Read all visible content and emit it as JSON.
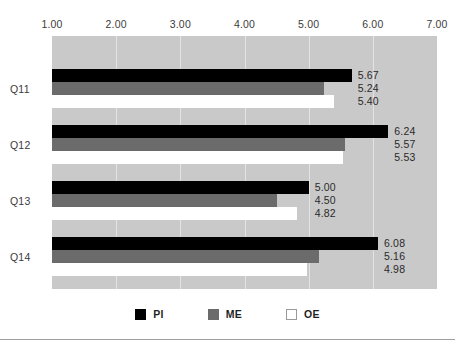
{
  "chart_data": {
    "type": "bar",
    "orientation": "horizontal",
    "title": "",
    "subtitle": "",
    "xlabel": "",
    "ylabel": "",
    "categories": [
      "Q11",
      "Q12",
      "Q13",
      "Q14"
    ],
    "series": [
      {
        "name": "PI",
        "color": "#000000",
        "values": [
          5.67,
          6.24,
          5.0,
          6.08
        ]
      },
      {
        "name": "ME",
        "color": "#6b6b6b",
        "values": [
          5.24,
          5.57,
          4.5,
          5.16
        ]
      },
      {
        "name": "OE",
        "color": "#ffffff",
        "values": [
          5.4,
          5.53,
          4.82,
          4.98
        ]
      }
    ],
    "value_labels": [
      [
        "5.67",
        "5.24",
        "5.40"
      ],
      [
        "6.24",
        "5.57",
        "5.53"
      ],
      [
        "5.00",
        "4.50",
        "4.82"
      ],
      [
        "6.08",
        "5.16",
        "4.98"
      ]
    ],
    "xlim": [
      1.0,
      7.0
    ],
    "xticks": [
      1.0,
      2.0,
      3.0,
      4.0,
      5.0,
      6.0,
      7.0
    ],
    "xtick_labels": [
      "1.00",
      "2.00",
      "3.00",
      "4.00",
      "5.00",
      "6.00",
      "7.00"
    ],
    "grid": true,
    "legend": {
      "position": "bottom",
      "entries": [
        {
          "label": "PI",
          "color": "#000000"
        },
        {
          "label": "ME",
          "color": "#6b6b6b"
        },
        {
          "label": "OE",
          "color": "#ffffff"
        }
      ]
    },
    "plot_background": "#c9c9c9",
    "gridline_color": "#e3e3e3"
  }
}
